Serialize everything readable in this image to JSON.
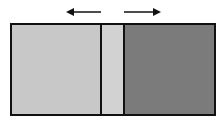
{
  "diagram": {
    "canvas": {
      "width": 221,
      "height": 127,
      "background": "#ffffff"
    },
    "box": {
      "x": 11,
      "y": 24,
      "width": 204,
      "height": 91,
      "stroke": "#111111",
      "stroke_width": 2
    },
    "regions": [
      {
        "name": "left-region",
        "x": 11,
        "x_end": 101,
        "fill": "#c8c8c8"
      },
      {
        "name": "middle-strip",
        "x": 101,
        "x_end": 124,
        "fill": "#d2d2d2"
      },
      {
        "name": "right-region",
        "x": 124,
        "x_end": 215,
        "fill": "#7b7b7b"
      }
    ],
    "dividers": [
      {
        "name": "left-divider",
        "x": 101
      },
      {
        "name": "right-divider",
        "x": 124
      }
    ],
    "arrows": [
      {
        "name": "left-arrow",
        "direction": "left",
        "x1": 101,
        "x2": 66,
        "y": 12,
        "color": "#111111"
      },
      {
        "name": "right-arrow",
        "direction": "right",
        "x1": 124,
        "x2": 161,
        "y": 12,
        "color": "#111111"
      }
    ]
  }
}
